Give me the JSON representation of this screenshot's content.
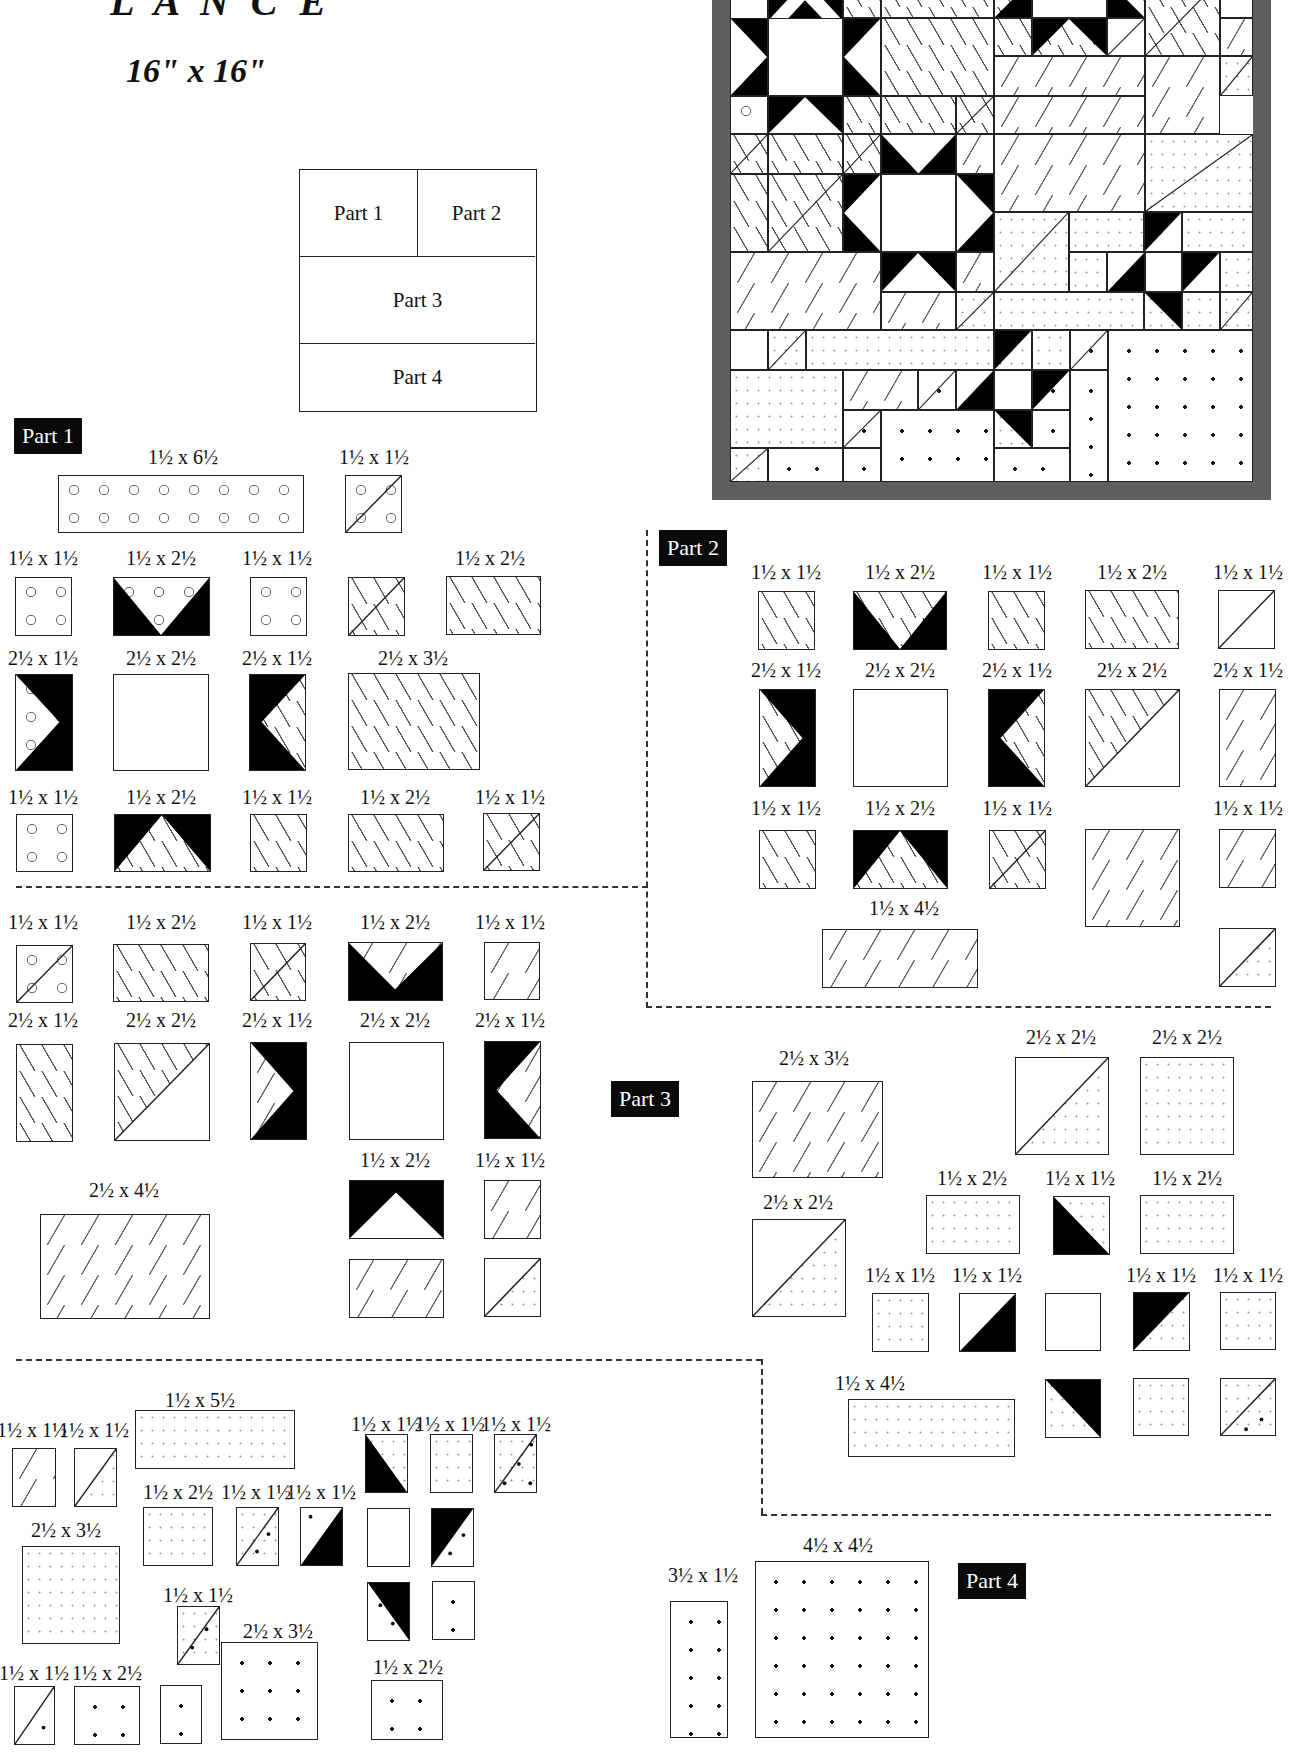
{
  "header": {
    "title_fragment": "L A N C E",
    "finished_size": "16\" x 16\""
  },
  "layout_diagram": {
    "cells": [
      "Part 1",
      "Part 2",
      "Part 3",
      "Part 4"
    ]
  },
  "parts": {
    "part1": {
      "label": "Part 1",
      "pieces": [
        {
          "size": "1½ x 6½",
          "fabric": "circles"
        },
        {
          "size": "1½ x 1½",
          "fabric": "half-square circles/dashes"
        },
        {
          "size": "1½ x 1½",
          "fabric": "circles"
        },
        {
          "size": "1½ x 2½",
          "fabric": "flying geese black/circles"
        },
        {
          "size": "1½ x 1½",
          "fabric": "circles"
        },
        {
          "size": "1½ x 1½",
          "fabric": "half-square circles/dashes"
        },
        {
          "size": "1½ x 2½",
          "fabric": "dashes"
        },
        {
          "size": "2½ x 1½",
          "fabric": "flying geese black/circles"
        },
        {
          "size": "2½ x 2½",
          "fabric": "plain white"
        },
        {
          "size": "2½ x 1½",
          "fabric": "flying geese black/dashes"
        },
        {
          "size": "2½ x 3½",
          "fabric": "dashes"
        },
        {
          "size": "1½ x 1½",
          "fabric": "circles"
        },
        {
          "size": "1½ x 2½",
          "fabric": "flying geese black/dashes"
        },
        {
          "size": "1½ x 1½",
          "fabric": "dashes"
        },
        {
          "size": "1½ x 2½",
          "fabric": "dashes"
        },
        {
          "size": "1½ x 1½",
          "fabric": "half-square dashes/triangles"
        }
      ]
    },
    "part2": {
      "label": "Part 2",
      "pieces": [
        {
          "size": "1½ x 1½",
          "fabric": "dashes"
        },
        {
          "size": "1½ x 2½",
          "fabric": "flying geese black/dashes"
        },
        {
          "size": "1½ x 1½",
          "fabric": "dashes"
        },
        {
          "size": "1½ x 2½",
          "fabric": "dashes"
        },
        {
          "size": "1½ x 1½",
          "fabric": "half-square dashes/white"
        },
        {
          "size": "2½ x 1½",
          "fabric": "flying geese black/dashes"
        },
        {
          "size": "2½ x 2½",
          "fabric": "plain white"
        },
        {
          "size": "2½ x 1½",
          "fabric": "flying geese black/dashes"
        },
        {
          "size": "2½ x 2½",
          "fabric": "half-square dashes/triangles"
        },
        {
          "size": "2½ x 1½",
          "fabric": "triangles"
        },
        {
          "size": "1½ x 1½",
          "fabric": "dashes"
        },
        {
          "size": "1½ x 2½",
          "fabric": "flying geese black/dashes"
        },
        {
          "size": "1½ x 1½",
          "fabric": "half-square dashes/triangles"
        },
        {
          "size": "",
          "fabric": "triangles (2½ x 2½)"
        },
        {
          "size": "1½ x 1½",
          "fabric": "triangles"
        },
        {
          "size": "1½ x 4½",
          "fabric": "triangles"
        },
        {
          "size": "",
          "fabric": "half-square triangles/speckle (1½ x 1½)"
        }
      ]
    },
    "part3": {
      "label": "Part 3",
      "pieces_left": [
        {
          "size": "1½ x 1½",
          "fabric": "half-square circles/dashes"
        },
        {
          "size": "1½ x 2½",
          "fabric": "dashes"
        },
        {
          "size": "1½ x 1½",
          "fabric": "half-square dashes/triangles"
        },
        {
          "size": "1½ x 2½",
          "fabric": "flying geese black/triangles"
        },
        {
          "size": "1½ x 1½",
          "fabric": "triangles"
        },
        {
          "size": "2½ x 1½",
          "fabric": "dashes"
        },
        {
          "size": "2½ x 2½",
          "fabric": "half-square dashes/triangles"
        },
        {
          "size": "2½ x 1½",
          "fabric": "flying geese black/triangles"
        },
        {
          "size": "2½ x 2½",
          "fabric": "plain white"
        },
        {
          "size": "2½ x 1½",
          "fabric": "flying geese black/triangles"
        },
        {
          "size": "2½ x 4½",
          "fabric": "triangles"
        },
        {
          "size": "1½ x 2½",
          "fabric": "flying geese black/white"
        },
        {
          "size": "1½ x 1½",
          "fabric": "triangles"
        },
        {
          "size": "",
          "fabric": "triangles (1½ x 2½)"
        },
        {
          "size": "",
          "fabric": "half-square triangles/speckle (1½ x 1½)"
        }
      ],
      "pieces_right": [
        {
          "size": "2½ x 3½",
          "fabric": "triangles"
        },
        {
          "size": "2½ x 2½",
          "fabric": "half-square triangles/speckle"
        },
        {
          "size": "2½ x 2½",
          "fabric": "speckle"
        },
        {
          "size": "2½ x 2½",
          "fabric": "half-square triangles/speckle"
        },
        {
          "size": "1½ x 2½",
          "fabric": "speckle"
        },
        {
          "size": "1½ x 1½",
          "fabric": "half-square black/speckle"
        },
        {
          "size": "1½ x 2½",
          "fabric": "speckle"
        },
        {
          "size": "1½ x 1½",
          "fabric": "speckle"
        },
        {
          "size": "1½ x 1½",
          "fabric": "half-square white/black"
        },
        {
          "size": "",
          "fabric": "plain white (1½ x 1½)"
        },
        {
          "size": "1½ x 1½",
          "fabric": "half-square black/speckle"
        },
        {
          "size": "1½ x 1½",
          "fabric": "speckle"
        },
        {
          "size": "1½ x 4½",
          "fabric": "speckle"
        },
        {
          "size": "",
          "fabric": "half-square black/speckle (1½ x 1½)"
        },
        {
          "size": "",
          "fabric": "speckle (1½ x 1½)"
        },
        {
          "size": "",
          "fabric": "half-square speckle/dots (1½ x 1½)"
        }
      ]
    },
    "part4": {
      "label": "Part 4",
      "pieces": [
        {
          "size": "1½ x 1½",
          "fabric": "triangles"
        },
        {
          "size": "1½ x 1½",
          "fabric": "half-square triangles/speckle"
        },
        {
          "size": "1½ x 5½",
          "fabric": "speckle"
        },
        {
          "size": "2½ x 3½",
          "fabric": "speckle"
        },
        {
          "size": "1½ x 2½",
          "fabric": "speckle"
        },
        {
          "size": "1½ x 1½",
          "fabric": "half-square speckle/dots"
        },
        {
          "size": "1½ x 1½",
          "fabric": "half-square dots/black"
        },
        {
          "size": "1½ x 1½",
          "fabric": "half-square black/speckle"
        },
        {
          "size": "1½ x 1½",
          "fabric": "speckle"
        },
        {
          "size": "1½ x 1½",
          "fabric": "half-square speckle/dots"
        },
        {
          "size": "",
          "fabric": "plain white (1½ x 1½)"
        },
        {
          "size": "",
          "fabric": "half-square black/dots (1½ x 1½)"
        },
        {
          "size": "",
          "fabric": "half-square black/dots (1½ x 1½)"
        },
        {
          "size": "",
          "fabric": "dots (1½ x 1½)"
        },
        {
          "size": "1½ x 1½",
          "fabric": "half-square speckle/dots"
        },
        {
          "size": "1½ x 1½",
          "fabric": "half-square triangles/dots"
        },
        {
          "size": "1½ x 2½",
          "fabric": "dots"
        },
        {
          "size": "",
          "fabric": "dots (1½ x 1½)"
        },
        {
          "size": "2½ x 3½",
          "fabric": "dots"
        },
        {
          "size": "1½ x 2½",
          "fabric": "dots"
        },
        {
          "size": "3½ x 1½",
          "fabric": "dots"
        },
        {
          "size": "4½ x 4½",
          "fabric": "dots"
        }
      ]
    }
  },
  "colors": {
    "ink": "#111111",
    "border_gray": "#5e5e5e",
    "paper": "#ffffff"
  }
}
